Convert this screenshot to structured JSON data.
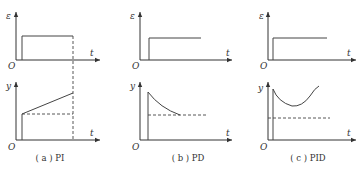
{
  "panels": [
    {
      "id": "a",
      "caption": "( a ) PI",
      "top": {
        "y_label": "ε",
        "x_label": "t",
        "origin": "O"
      },
      "bottom": {
        "y_label": "y",
        "x_label": "t",
        "origin": "O"
      },
      "controller": "PI"
    },
    {
      "id": "b",
      "caption": "( b ) PD",
      "top": {
        "y_label": "ε",
        "x_label": "t",
        "origin": "O"
      },
      "bottom": {
        "y_label": "y",
        "x_label": "t",
        "origin": "O"
      },
      "controller": "PD"
    },
    {
      "id": "c",
      "caption": "( c ) PID",
      "top": {
        "y_label": "ε",
        "x_label": "t",
        "origin": "O"
      },
      "bottom": {
        "y_label": "y",
        "x_label": "t",
        "origin": "O"
      },
      "controller": "PID"
    }
  ]
}
